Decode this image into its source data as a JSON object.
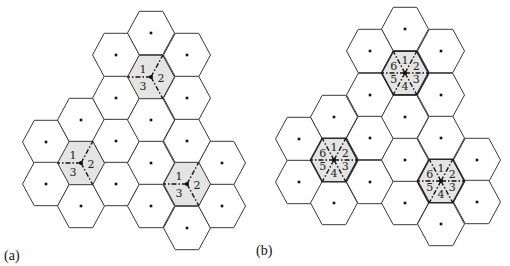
{
  "figure": {
    "panels": [
      {
        "id": "a",
        "label": "(a)",
        "label_pos": {
          "x": 4,
          "y": 248
        },
        "hex_radius": 23.5,
        "hex_half_height": 21.7,
        "sectors": 3,
        "sector_labels": [
          "1",
          "2",
          "3"
        ],
        "thick_shaded_border": false,
        "cells": [
          {
            "x": 46,
            "y": 142
          },
          {
            "x": 46,
            "y": 184
          },
          {
            "x": 81,
            "y": 120
          },
          {
            "x": 81,
            "y": 163,
            "shaded": true
          },
          {
            "x": 81,
            "y": 206
          },
          {
            "x": 116,
            "y": 55
          },
          {
            "x": 116,
            "y": 98
          },
          {
            "x": 116,
            "y": 141
          },
          {
            "x": 116,
            "y": 184
          },
          {
            "x": 151,
            "y": 33
          },
          {
            "x": 151,
            "y": 77,
            "shaded": true
          },
          {
            "x": 151,
            "y": 120
          },
          {
            "x": 151,
            "y": 163
          },
          {
            "x": 151,
            "y": 206
          },
          {
            "x": 187,
            "y": 55
          },
          {
            "x": 187,
            "y": 98
          },
          {
            "x": 187,
            "y": 141
          },
          {
            "x": 187,
            "y": 184,
            "shaded": true
          },
          {
            "x": 187,
            "y": 228
          },
          {
            "x": 222,
            "y": 163
          },
          {
            "x": 222,
            "y": 206
          }
        ]
      },
      {
        "id": "b",
        "label": "(b)",
        "label_pos": {
          "x": 256,
          "y": 243
        },
        "hex_radius": 23.5,
        "hex_half_height": 21.7,
        "sectors": 6,
        "sector_labels": [
          "1",
          "2",
          "3",
          "4",
          "5",
          "6"
        ],
        "thick_shaded_border": true,
        "cells": [
          {
            "x": 299,
            "y": 139
          },
          {
            "x": 299,
            "y": 182
          },
          {
            "x": 334,
            "y": 117
          },
          {
            "x": 334,
            "y": 160,
            "shaded": true
          },
          {
            "x": 334,
            "y": 203
          },
          {
            "x": 370,
            "y": 51
          },
          {
            "x": 370,
            "y": 95
          },
          {
            "x": 370,
            "y": 138
          },
          {
            "x": 370,
            "y": 182
          },
          {
            "x": 405,
            "y": 29
          },
          {
            "x": 405,
            "y": 73,
            "shaded": true
          },
          {
            "x": 405,
            "y": 117
          },
          {
            "x": 405,
            "y": 160
          },
          {
            "x": 405,
            "y": 203
          },
          {
            "x": 441,
            "y": 51
          },
          {
            "x": 441,
            "y": 95
          },
          {
            "x": 441,
            "y": 138
          },
          {
            "x": 441,
            "y": 181,
            "shaded": true
          },
          {
            "x": 441,
            "y": 224
          },
          {
            "x": 477,
            "y": 160
          },
          {
            "x": 477,
            "y": 202
          }
        ]
      }
    ]
  }
}
